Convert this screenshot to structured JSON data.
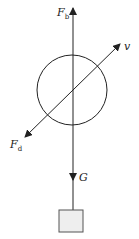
{
  "diagram": {
    "labels": {
      "buoyancy": {
        "main": "F",
        "sub": "b"
      },
      "drag": {
        "main": "F",
        "sub": "d"
      },
      "velocity": {
        "main": "v"
      },
      "gravity": {
        "main": "G"
      }
    },
    "colors": {
      "stroke": "#222222",
      "box_fill": "#eeeeee",
      "box_stroke": "#555555"
    }
  }
}
